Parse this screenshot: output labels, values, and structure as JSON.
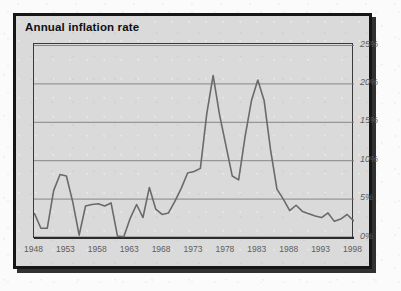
{
  "figure": {
    "title": "Annual inflation rate",
    "background_color": "#dadada",
    "frame_color": "#161616",
    "line_color": "#6a6a6a",
    "grid_color": "#7d7d7d",
    "axis_color": "#2b2b2b",
    "tick_text_color": "#5d5d5d"
  },
  "chart_data": {
    "type": "line",
    "title": "Annual inflation rate",
    "xlabel": "",
    "ylabel": "",
    "xlim": [
      1948,
      1998
    ],
    "ylim": [
      0,
      25
    ],
    "grid": true,
    "legend": null,
    "x_ticks": [
      "1948",
      "1953",
      "1958",
      "1963",
      "1968",
      "1973",
      "1978",
      "1983",
      "1988",
      "1993",
      "1998"
    ],
    "x_tick_values": [
      1948,
      1953,
      1958,
      1963,
      1968,
      1973,
      1978,
      1983,
      1988,
      1993,
      1998
    ],
    "y_ticks": [
      "0%",
      "5%",
      "10%",
      "15%",
      "20%",
      "25%"
    ],
    "y_tick_values": [
      0,
      5,
      10,
      15,
      20,
      25
    ],
    "series": [
      {
        "name": "Annual inflation rate",
        "x": [
          1948,
          1949,
          1950,
          1951,
          1952,
          1953,
          1954,
          1955,
          1956,
          1957,
          1958,
          1959,
          1960,
          1961,
          1962,
          1963,
          1964,
          1965,
          1966,
          1967,
          1968,
          1969,
          1970,
          1971,
          1972,
          1973,
          1974,
          1975,
          1976,
          1977,
          1978,
          1979,
          1980,
          1981,
          1982,
          1983,
          1984,
          1985,
          1986,
          1987,
          1988,
          1989,
          1990,
          1991,
          1992,
          1993,
          1994,
          1995,
          1996,
          1997,
          1998
        ],
        "values": [
          3.1,
          1.2,
          1.2,
          6.1,
          8.2,
          8.0,
          4.6,
          0.3,
          4.1,
          4.3,
          4.4,
          4.1,
          4.5,
          0.2,
          0.1,
          2.5,
          4.3,
          2.6,
          6.5,
          3.7,
          3.0,
          3.2,
          4.7,
          6.4,
          8.4,
          8.6,
          9.0,
          16.1,
          21.1,
          16.0,
          12.0,
          8.0,
          7.5,
          13.1,
          17.8,
          20.5,
          17.8,
          11.4,
          6.3,
          5.0,
          3.5,
          4.2,
          3.4,
          3.1,
          2.8,
          2.6,
          3.2,
          2.1,
          2.4,
          3.0,
          2.2
        ]
      }
    ]
  }
}
